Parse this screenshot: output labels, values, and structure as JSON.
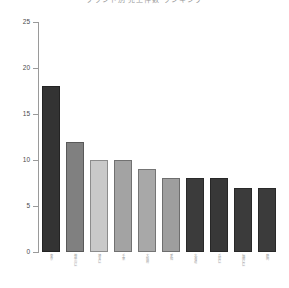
{
  "chart_data": {
    "type": "bar",
    "title": "ブランド別 売上件数 ランキング",
    "xlabel": "",
    "ylabel": "",
    "ylim": [
      0,
      25
    ],
    "yticks": [
      0,
      5,
      10,
      15,
      20,
      25
    ],
    "grid": false,
    "legend": null,
    "categories": [
      "東京",
      "神奈川県",
      "埼玉県",
      "千葉",
      "大阪府",
      "愛知",
      "北海道",
      "兵庫県",
      "福岡県県",
      "静岡"
    ],
    "values": [
      18,
      12,
      10,
      10,
      9,
      8,
      8,
      8,
      7,
      7
    ],
    "bar_colors": [
      "#333333",
      "#808080",
      "#c9c9c9",
      "#a3a3a3",
      "#a8a8a8",
      "#9e9e9e",
      "#3b3b3b",
      "#383838",
      "#3b3b3b",
      "#3b3b3b"
    ]
  },
  "axis": {
    "tick_color": "#9a9a9a",
    "label_color": "#4a4a4a"
  }
}
